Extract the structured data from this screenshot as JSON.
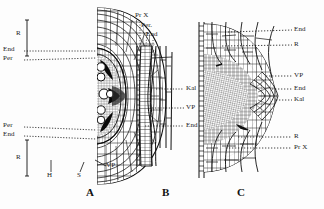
{
  "figure": {
    "background_color": "#fdfdfd",
    "ink_color": "#111111",
    "panel_letters": [
      {
        "id": "A",
        "label": "A",
        "x": 86,
        "y": 186
      },
      {
        "id": "B",
        "label": "B",
        "x": 162,
        "y": 186
      },
      {
        "id": "C",
        "label": "C",
        "x": 237,
        "y": 186
      }
    ]
  },
  "panels": {
    "A": {
      "name": "A",
      "caption": "A",
      "description": "Transverse section of root, half view showing cortex, endodermis, pericycle and vascular tissue",
      "labels": [
        {
          "key": "R_upper",
          "text": "R",
          "x": 16,
          "y": 34,
          "side": "left"
        },
        {
          "key": "End_upper",
          "text": "End",
          "x": 4,
          "y": 49,
          "side": "left"
        },
        {
          "key": "Per_upper",
          "text": "Per",
          "x": 4,
          "y": 58,
          "side": "left"
        },
        {
          "key": "Per_lower",
          "text": "Per",
          "x": 4,
          "y": 125,
          "side": "left"
        },
        {
          "key": "End_lower",
          "text": "End",
          "x": 4,
          "y": 134,
          "side": "left"
        },
        {
          "key": "R_lower",
          "text": "R",
          "x": 16,
          "y": 158,
          "side": "left"
        },
        {
          "key": "H",
          "text": "H",
          "x": 48,
          "y": 176,
          "side": "bottom"
        },
        {
          "key": "S",
          "text": "S",
          "x": 77,
          "y": 176,
          "side": "bottom"
        },
        {
          "key": "VP",
          "text": "VP",
          "x": 94,
          "y": 158,
          "side": "right"
        }
      ]
    },
    "B": {
      "name": "B",
      "caption": "B",
      "description": "Longitudinal section of root tip, narrow strip showing protoxylem, pericycle, endodermis, vegetation point and root cap",
      "labels": [
        {
          "key": "PrX",
          "text": "Pr X",
          "x": 137,
          "y": 15,
          "side": "top"
        },
        {
          "key": "Per",
          "text": "Per.",
          "x": 143,
          "y": 25,
          "side": "top"
        },
        {
          "key": "End",
          "text": "End",
          "x": 148,
          "y": 33,
          "side": "top"
        },
        {
          "key": "Kal",
          "text": "Kal",
          "x": 186,
          "y": 86,
          "side": "right"
        },
        {
          "key": "VP",
          "text": "VP",
          "x": 186,
          "y": 105,
          "side": "right"
        },
        {
          "key": "End2",
          "text": "End",
          "x": 186,
          "y": 123,
          "side": "right"
        }
      ]
    },
    "C": {
      "name": "C",
      "caption": "C",
      "description": "Enlarged longitudinal section of root apex showing cortex, endodermis, vegetation point, root cap and protoxylem",
      "labels": [
        {
          "key": "End_top",
          "text": "End",
          "x": 296,
          "y": 28,
          "side": "right"
        },
        {
          "key": "R_top",
          "text": "R",
          "x": 296,
          "y": 43,
          "side": "right"
        },
        {
          "key": "VP",
          "text": "VP",
          "x": 296,
          "y": 74,
          "side": "right"
        },
        {
          "key": "End_mid",
          "text": "End",
          "x": 296,
          "y": 87,
          "side": "right"
        },
        {
          "key": "Kal",
          "text": "Kal",
          "x": 296,
          "y": 98,
          "side": "right"
        },
        {
          "key": "R_bot",
          "text": "R",
          "x": 296,
          "y": 135,
          "side": "right"
        },
        {
          "key": "PrX",
          "text": "Pr X",
          "x": 296,
          "y": 146,
          "side": "right"
        }
      ]
    }
  },
  "legend_keys": [
    {
      "abbr": "R",
      "meaning": "Rinde (cortex)"
    },
    {
      "abbr": "End",
      "meaning": "Endodermis"
    },
    {
      "abbr": "Per",
      "meaning": "Perizykel (pericycle)"
    },
    {
      "abbr": "VP",
      "meaning": "Vegetationspunkt (apical meristem)"
    },
    {
      "abbr": "Kal",
      "meaning": "Kalyptra (root cap)"
    },
    {
      "abbr": "Pr X",
      "meaning": "Protoxylem"
    },
    {
      "abbr": "H",
      "meaning": "Haar (root hair)"
    },
    {
      "abbr": "S",
      "meaning": "Scheitel"
    }
  ]
}
